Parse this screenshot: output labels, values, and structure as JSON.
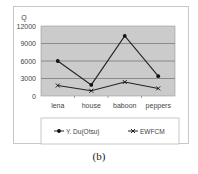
{
  "chart_data": {
    "type": "line",
    "title": "",
    "ylabel": "Q",
    "xlabel": "",
    "categories": [
      "lena",
      "house",
      "baboon",
      "peppers"
    ],
    "series": [
      {
        "name": "Y. Du(Otsu)",
        "marker": "diamond",
        "values": [
          6000,
          1900,
          10300,
          3400
        ]
      },
      {
        "name": "EWFCM",
        "marker": "x",
        "values": [
          1800,
          900,
          2400,
          1300
        ]
      }
    ],
    "ylim": [
      0,
      12000
    ],
    "yticks": [
      "0",
      "3000",
      "6000",
      "9000",
      "12000"
    ],
    "grid": true,
    "plot_background": "#c8c8c8",
    "legend_position": "bottom"
  },
  "caption": "(b)"
}
